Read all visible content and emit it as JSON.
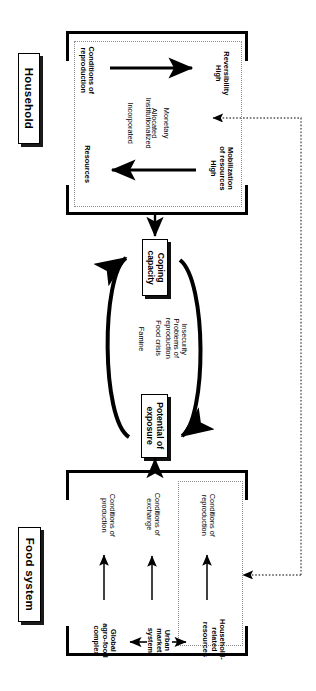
{
  "diagram": {
    "title_visible": false,
    "orientation": "rotated-90",
    "sections": {
      "household": {
        "label": "Household",
        "conditions_heading": "Conditions of reproduction",
        "resources_heading": "Resources",
        "resource_types": [
          "Incorporated",
          "Institutionalized",
          "Allocated",
          "Monetary"
        ],
        "outcome_top": {
          "name": "Reversibility",
          "level": "High"
        },
        "outcome_bottom": {
          "name": "Mobilization of resources",
          "level": "High"
        }
      },
      "food_system": {
        "label": "Food system",
        "actors": [
          "Global agro-food complex",
          "Urban market system",
          "Household-related resources"
        ],
        "conditions": [
          "Conditions of production",
          "Conditions of exchange",
          "Conditions of reproduction"
        ]
      }
    },
    "cycle": {
      "node_top": "Coping capacity",
      "node_bottom": "Potential of exposure",
      "stages": [
        "Famine",
        "Food crisis",
        "Problems of reproduction",
        "Insecurity"
      ]
    },
    "colors": {
      "ink": "#000000",
      "shadow": "#111111",
      "dotted": "#8c8c8c",
      "paper": "#ffffff"
    }
  }
}
